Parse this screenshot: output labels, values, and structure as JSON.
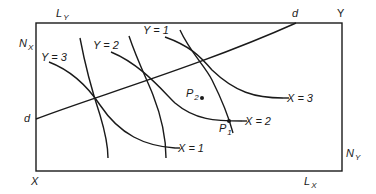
{
  "diagram": {
    "type": "edgeworth-box",
    "colors": {
      "line": "#1a1a1a",
      "background": "#ffffff"
    },
    "box": {
      "x": 36,
      "y": 23,
      "width": 306,
      "height": 148
    },
    "corners": {
      "origin_x": {
        "text": "X"
      },
      "origin_y": {
        "text": "Y"
      }
    },
    "axis_labels": {
      "L_Y": {
        "main": "L",
        "sub": "Y"
      },
      "N_X": {
        "main": "N",
        "sub": "X"
      },
      "N_Y": {
        "main": "N",
        "sub": "Y"
      },
      "L_X": {
        "main": "L",
        "sub": "X"
      }
    },
    "contract_curve": {
      "label_start": "d",
      "label_end": "d",
      "path": "M36,119 C90,98 200,66 296,23"
    },
    "isoquants_y": [
      {
        "label": "Y = 3",
        "path": "M49,62 C75,72 90,90 100,105 C120,135 145,146 175,148"
      },
      {
        "label": "Y = 2",
        "path": "M111,52 C140,64 160,88 175,103 C195,120 215,121 242,121"
      },
      {
        "label": "Y = 1",
        "path": "M165,37 C190,46 200,56 212,70 C235,92 255,98 283,98"
      }
    ],
    "isoquants_x": [
      {
        "label": "X = 1",
        "path": "M80,38 C86,70 95,100 100,115 C106,135 108,150 108,158"
      },
      {
        "label": "X = 2",
        "path": "M129,36 C137,60 148,82 153,95 C162,118 166,140 166,158"
      },
      {
        "label": "X = 3",
        "path": "M180,30 C190,52 205,66 212,80 C222,100 229,118 233,133"
      }
    ],
    "points": [
      {
        "name": "P",
        "sub": "1",
        "cx": 229,
        "cy": 121
      },
      {
        "name": "P",
        "sub": "2",
        "cx": 202,
        "cy": 98
      }
    ]
  }
}
